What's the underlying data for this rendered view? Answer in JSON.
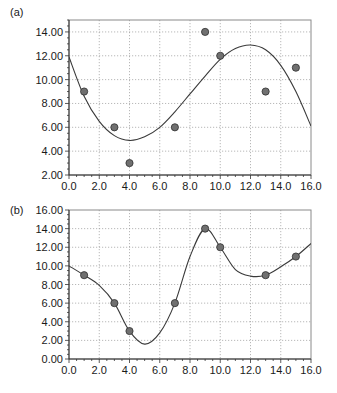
{
  "chart_data": [
    {
      "type": "scatter",
      "panel_label": "(a)",
      "title": "",
      "xlabel": "",
      "ylabel": "",
      "xlim": [
        0,
        16
      ],
      "ylim": [
        2,
        15
      ],
      "xticks": [
        "0.0",
        "2.0",
        "4.0",
        "6.0",
        "8.0",
        "10.0",
        "12.0",
        "14.0",
        "16.0"
      ],
      "yticks": [
        "2.00",
        "4.00",
        "6.00",
        "8.00",
        "10.00",
        "12.00",
        "14.00"
      ],
      "grid": true,
      "legend": null,
      "series": [
        {
          "name": "data points",
          "kind": "scatter",
          "x": [
            1,
            3,
            4,
            7,
            9,
            10,
            13,
            15
          ],
          "y": [
            9,
            6,
            3,
            6,
            14,
            12,
            9,
            11
          ]
        },
        {
          "name": "fitted curve",
          "kind": "line",
          "x": [
            0,
            1,
            2,
            3,
            4,
            5,
            6,
            7,
            8,
            9,
            10,
            11,
            12,
            13,
            14,
            15,
            16
          ],
          "y": [
            11.9,
            8.6,
            6.5,
            5.3,
            4.9,
            5.2,
            6.0,
            7.3,
            8.8,
            10.3,
            11.7,
            12.6,
            12.9,
            12.5,
            11.2,
            9.0,
            6.1
          ]
        }
      ]
    },
    {
      "type": "scatter",
      "panel_label": "(b)",
      "title": "",
      "xlabel": "",
      "ylabel": "",
      "xlim": [
        0,
        16
      ],
      "ylim": [
        0,
        16
      ],
      "xticks": [
        "0.0",
        "2.0",
        "4.0",
        "6.0",
        "8.0",
        "10.0",
        "12.0",
        "14.0",
        "16.0"
      ],
      "yticks": [
        "0.00",
        "2.00",
        "4.00",
        "6.00",
        "8.00",
        "10.00",
        "12.00",
        "14.00",
        "16.00"
      ],
      "grid": true,
      "legend": null,
      "series": [
        {
          "name": "data points",
          "kind": "scatter",
          "x": [
            1,
            3,
            4,
            7,
            9,
            10,
            13,
            15
          ],
          "y": [
            9,
            6,
            3,
            6,
            14,
            12,
            9,
            11
          ]
        },
        {
          "name": "interpolating curve",
          "kind": "line",
          "x": [
            0,
            1,
            2,
            3,
            4,
            5,
            6,
            7,
            8,
            9,
            10,
            11,
            12,
            13,
            14,
            15,
            16
          ],
          "y": [
            10.0,
            9.0,
            7.9,
            6.0,
            3.0,
            1.6,
            2.8,
            6.0,
            11.0,
            14.0,
            12.0,
            9.6,
            8.9,
            9.0,
            9.9,
            11.0,
            12.4
          ]
        }
      ]
    }
  ]
}
